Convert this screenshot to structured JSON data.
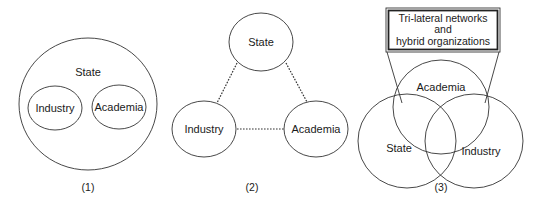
{
  "diagram": {
    "panel1": {
      "caption": "(1)",
      "outer_label": "State",
      "inner_left_label": "Industry",
      "inner_right_label": "Academia"
    },
    "panel2": {
      "caption": "(2)",
      "top_label": "State",
      "left_label": "Industry",
      "right_label": "Academia",
      "connector_style": "dotted"
    },
    "panel3": {
      "caption": "(3)",
      "callout_lines": [
        "Tri-lateral networks",
        "and",
        "hybrid organizations"
      ],
      "top_label": "Academia",
      "left_label": "State",
      "right_label": "Industry"
    }
  },
  "colors": {
    "stroke": "#333333",
    "text": "#1a1a1a",
    "background": "#ffffff"
  }
}
